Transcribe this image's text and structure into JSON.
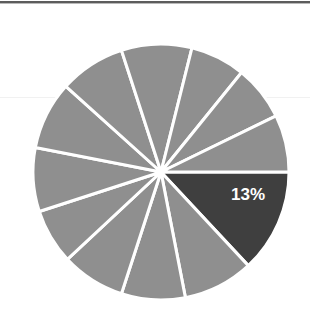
{
  "chart_data": {
    "type": "pie",
    "title": "",
    "subtitle": "",
    "xlabel": "",
    "ylabel": "",
    "legend": "none",
    "grid": false,
    "labels": [
      "Segment 1",
      "Segment 2",
      "Segment 3",
      "Segment 4",
      "Segment 5",
      "Segment 6",
      "Segment 7",
      "Segment 8",
      "Segment 9",
      "Segment 10",
      "Segment 11",
      "Segment 12"
    ],
    "values": [
      13,
      9,
      8,
      8,
      7,
      8,
      9,
      8,
      9,
      7,
      7,
      7
    ],
    "units": "percent",
    "data_labels": [
      "13%",
      "",
      "",
      "",
      "",
      "",
      "",
      "",
      "",
      "",
      "",
      ""
    ],
    "highlighted_index": 0,
    "highlighted_label": "13%",
    "colors": {
      "highlight": "#3f3f3f",
      "base": "#8f8f8f",
      "separator": "#ffffff",
      "label_text": "#ffffff",
      "background": "#ffffff",
      "top_rule": "#5c5c5c",
      "faint_rule": "#f1f1f1"
    },
    "geometry": {
      "center_x": 161,
      "center_y": 172,
      "radius": 128,
      "start_angle_deg": 0,
      "direction": "clockwise",
      "separator_width_px": 3
    },
    "slice_boundaries_deg": [
      0,
      47,
      79,
      108,
      137,
      162,
      191,
      222,
      252,
      284,
      309,
      334,
      360
    ],
    "label_position": {
      "x": 248,
      "y": 200
    }
  },
  "figure": {
    "top_rule_present": true,
    "faint_rule_y": 97
  }
}
